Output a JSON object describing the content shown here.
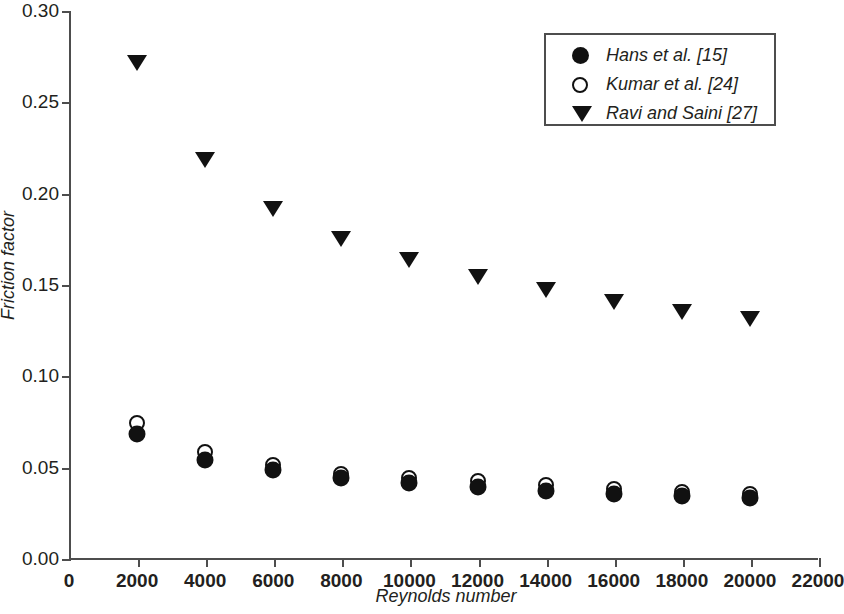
{
  "chart_data": {
    "type": "scatter",
    "title": "",
    "xlabel": "Reynolds number",
    "ylabel": "Friction factor",
    "xlim": [
      0,
      22000
    ],
    "ylim": [
      0.0,
      0.3
    ],
    "xticks": [
      "0",
      "2000",
      "4000",
      "6000",
      "8000",
      "10000",
      "12000",
      "14000",
      "16000",
      "18000",
      "20000",
      "22000"
    ],
    "xtick_values": [
      0,
      2000,
      4000,
      6000,
      8000,
      10000,
      12000,
      14000,
      16000,
      18000,
      20000,
      22000
    ],
    "yticks": [
      "0.00",
      "0.05",
      "0.10",
      "0.15",
      "0.20",
      "0.25",
      "0.30"
    ],
    "ytick_values": [
      0.0,
      0.05,
      0.1,
      0.15,
      0.2,
      0.25,
      0.3
    ],
    "grid": false,
    "legend_position": "top-right",
    "x": [
      2000,
      4000,
      6000,
      8000,
      10000,
      12000,
      14000,
      16000,
      18000,
      20000
    ],
    "series": [
      {
        "name": "Hans et al. [15]",
        "marker": "filled-circle",
        "color": "#111111",
        "values": [
          0.069,
          0.055,
          0.049,
          0.045,
          0.042,
          0.04,
          0.038,
          0.036,
          0.035,
          0.034
        ]
      },
      {
        "name": "Kumar et al. [24]",
        "marker": "open-circle",
        "color": "#111111",
        "values": [
          0.075,
          0.059,
          0.052,
          0.047,
          0.045,
          0.043,
          0.041,
          0.039,
          0.037,
          0.036
        ]
      },
      {
        "name": "Ravi and Saini [27]",
        "marker": "filled-down-triangle",
        "color": "#111111",
        "values": [
          0.272,
          0.219,
          0.192,
          0.176,
          0.164,
          0.155,
          0.148,
          0.141,
          0.136,
          0.132
        ]
      }
    ]
  },
  "axes": {
    "frame_color": "#4d4d4d",
    "background": "#ffffff"
  },
  "legend": {
    "entries": [
      {
        "label": "Hans et al. [15]",
        "marker": "filled-circle"
      },
      {
        "label": "Kumar et al. [24]",
        "marker": "open-circle"
      },
      {
        "label": "Ravi and Saini [27]",
        "marker": "filled-down-triangle"
      }
    ]
  }
}
